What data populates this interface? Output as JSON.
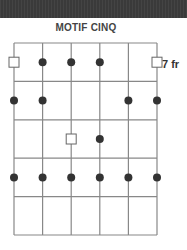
{
  "title": "MOTIF CINQ",
  "fret_label": "7 fr",
  "diagram": {
    "strings": 6,
    "frets": 5,
    "colors": {
      "grid": "#888888",
      "dot": "#333333",
      "square": "#666666",
      "header": "#3a3a3a"
    },
    "markers": [
      {
        "fret": 1,
        "string": 1,
        "type": "square"
      },
      {
        "fret": 1,
        "string": 2,
        "type": "dot"
      },
      {
        "fret": 1,
        "string": 3,
        "type": "dot"
      },
      {
        "fret": 1,
        "string": 4,
        "type": "dot"
      },
      {
        "fret": 1,
        "string": 6,
        "type": "square"
      },
      {
        "fret": 2,
        "string": 1,
        "type": "dot"
      },
      {
        "fret": 2,
        "string": 2,
        "type": "dot"
      },
      {
        "fret": 2,
        "string": 5,
        "type": "dot"
      },
      {
        "fret": 2,
        "string": 6,
        "type": "dot"
      },
      {
        "fret": 3,
        "string": 3,
        "type": "square"
      },
      {
        "fret": 3,
        "string": 4,
        "type": "dot"
      },
      {
        "fret": 4,
        "string": 1,
        "type": "dot"
      },
      {
        "fret": 4,
        "string": 2,
        "type": "dot"
      },
      {
        "fret": 4,
        "string": 3,
        "type": "dot"
      },
      {
        "fret": 4,
        "string": 4,
        "type": "dot"
      },
      {
        "fret": 4,
        "string": 5,
        "type": "dot"
      },
      {
        "fret": 4,
        "string": 6,
        "type": "dot"
      }
    ]
  }
}
